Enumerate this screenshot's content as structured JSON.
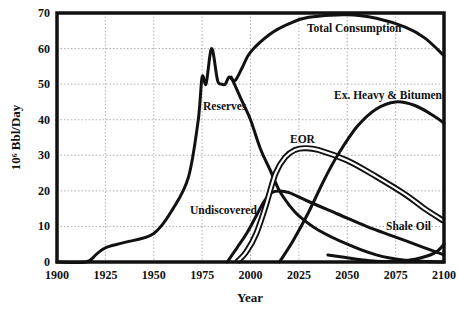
{
  "chart_data": {
    "type": "line",
    "title": "",
    "xlabel": "Year",
    "ylabel": "10⁶ Bbl/Day",
    "xlim": [
      1900,
      2100
    ],
    "ylim": [
      0,
      70
    ],
    "grid": true,
    "legend": "none (inline annotations)",
    "x_ticks": [
      "1900",
      "1925",
      "1950",
      "1975",
      "2000",
      "2025",
      "2050",
      "2075",
      "2100"
    ],
    "y_ticks": [
      "0",
      "10",
      "20",
      "30",
      "40",
      "50",
      "60",
      "70"
    ],
    "series": [
      {
        "name": "Total Consumption",
        "points": [
          [
            1900,
            0
          ],
          [
            1915,
            0
          ],
          [
            1920,
            2
          ],
          [
            1925,
            4
          ],
          [
            1935,
            5.5
          ],
          [
            1950,
            8
          ],
          [
            1960,
            15
          ],
          [
            1968,
            24
          ],
          [
            1973,
            40
          ],
          [
            1975,
            52
          ],
          [
            1977,
            50
          ],
          [
            1979,
            58
          ],
          [
            1980,
            60
          ],
          [
            1981,
            58
          ],
          [
            1983,
            51
          ],
          [
            1985,
            50
          ],
          [
            1987,
            50
          ],
          [
            1989,
            52
          ],
          [
            1992,
            51
          ],
          [
            1996,
            55
          ],
          [
            2000,
            59
          ],
          [
            2010,
            64
          ],
          [
            2020,
            67
          ],
          [
            2030,
            68.8
          ],
          [
            2050,
            69.5
          ],
          [
            2065,
            68.5
          ],
          [
            2080,
            66
          ],
          [
            2090,
            63
          ],
          [
            2100,
            58
          ]
        ]
      },
      {
        "name": "Reserves",
        "points": [
          [
            1990,
            52
          ],
          [
            1995,
            46
          ],
          [
            2000,
            40
          ],
          [
            2005,
            32
          ],
          [
            2010,
            26
          ],
          [
            2015,
            20
          ],
          [
            2020,
            16
          ],
          [
            2025,
            13
          ],
          [
            2035,
            9
          ],
          [
            2050,
            5
          ],
          [
            2065,
            2
          ],
          [
            2080,
            0.5
          ],
          [
            2100,
            0
          ]
        ]
      },
      {
        "name": "Undiscovered",
        "points": [
          [
            1988,
            0
          ],
          [
            1993,
            4
          ],
          [
            1998,
            8
          ],
          [
            2003,
            13
          ],
          [
            2007,
            17
          ],
          [
            2011,
            19.5
          ],
          [
            2015,
            20
          ],
          [
            2020,
            19.5
          ],
          [
            2030,
            17
          ],
          [
            2045,
            13.5
          ],
          [
            2060,
            10
          ],
          [
            2075,
            7
          ],
          [
            2090,
            4
          ],
          [
            2100,
            2
          ]
        ]
      },
      {
        "name": "EOR",
        "points": [
          [
            1993,
            0
          ],
          [
            1998,
            3
          ],
          [
            2003,
            8
          ],
          [
            2008,
            16
          ],
          [
            2013,
            25
          ],
          [
            2018,
            29.5
          ],
          [
            2023,
            31.5
          ],
          [
            2028,
            32
          ],
          [
            2035,
            31.5
          ],
          [
            2050,
            28.5
          ],
          [
            2065,
            24
          ],
          [
            2080,
            19
          ],
          [
            2090,
            15
          ],
          [
            2100,
            11.5
          ]
        ]
      },
      {
        "name": "Ex. Heavy & Bitumen",
        "points": [
          [
            2015,
            0
          ],
          [
            2022,
            6
          ],
          [
            2030,
            14
          ],
          [
            2038,
            23
          ],
          [
            2045,
            30
          ],
          [
            2055,
            38
          ],
          [
            2065,
            43
          ],
          [
            2075,
            45
          ],
          [
            2085,
            44
          ],
          [
            2095,
            41
          ],
          [
            2100,
            39
          ]
        ]
      },
      {
        "name": "Shale Oil",
        "points": [
          [
            2040,
            2
          ],
          [
            2055,
            0.8
          ],
          [
            2065,
            0.2
          ],
          [
            2075,
            0.2
          ],
          [
            2085,
            0.8
          ],
          [
            2095,
            2.5
          ],
          [
            2100,
            5
          ]
        ]
      }
    ],
    "annotations": [
      {
        "text": "Total Consumption",
        "x": 2048,
        "y": 66.5
      },
      {
        "text": "Reserves",
        "x": 1976,
        "y": 43
      },
      {
        "text": "EOR",
        "x": 2020,
        "y": 34
      },
      {
        "text": "Ex. Heavy & Bitumen",
        "x": 2045,
        "y": 46.5
      },
      {
        "text": "Undiscovered",
        "x": 1972,
        "y": 16
      },
      {
        "text": "Shale Oil",
        "x": 2068,
        "y": 9
      }
    ]
  },
  "labels": {
    "y_axis_title": "10⁶ Bbl/Day",
    "x_axis_title": "Year",
    "total_consumption": "Total Consumption",
    "reserves": "Reserves",
    "eor": "EOR",
    "ex_heavy": "Ex. Heavy & Bitumen",
    "undiscovered": "Undiscovered",
    "shale_oil": "Shale Oil"
  }
}
